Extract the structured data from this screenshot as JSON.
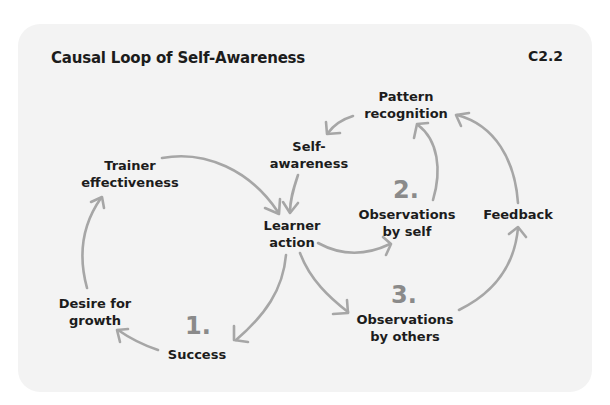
{
  "diagram": {
    "title": "Causal Loop of Self-Awareness",
    "code": "C2.2",
    "colors": {
      "background": "#f3f3f3",
      "text": "#1c1c1c",
      "arrow": "#a6a6a6",
      "number": "#8a8a8a"
    },
    "nodes": {
      "trainer_effectiveness": "Trainer\neffectiveness",
      "learner_action": "Learner\naction",
      "self_awareness": "Self-\nawareness",
      "pattern_recognition": "Pattern\nrecognition",
      "observations_by_self": "Observations\nby self",
      "feedback": "Feedback",
      "observations_by_others": "Observations\nby others",
      "success": "Success",
      "desire_for_growth": "Desire for\ngrowth"
    },
    "numbers": {
      "one": "1.",
      "two": "2.",
      "three": "3."
    },
    "edges": [
      {
        "from": "Trainer effectiveness",
        "to": "Learner action"
      },
      {
        "from": "Self-awareness",
        "to": "Learner action"
      },
      {
        "from": "Learner action",
        "to": "Observations by self"
      },
      {
        "from": "Learner action",
        "to": "Observations by others"
      },
      {
        "from": "Learner action",
        "to": "Success"
      },
      {
        "from": "Observations by self",
        "to": "Pattern recognition"
      },
      {
        "from": "Observations by others",
        "to": "Feedback"
      },
      {
        "from": "Feedback",
        "to": "Pattern recognition"
      },
      {
        "from": "Pattern recognition",
        "to": "Self-awareness"
      },
      {
        "from": "Success",
        "to": "Desire for growth"
      },
      {
        "from": "Desire for growth",
        "to": "Trainer effectiveness"
      }
    ]
  }
}
